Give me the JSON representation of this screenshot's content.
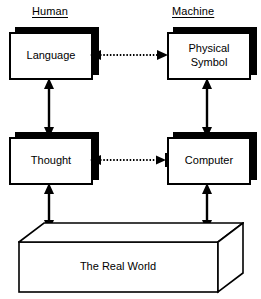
{
  "diagram": {
    "columns": [
      {
        "label": "Human"
      },
      {
        "label": "Machine"
      }
    ],
    "nodes": [
      {
        "id": "language",
        "label": "Language",
        "column": "Human",
        "row": "top"
      },
      {
        "id": "psymbol",
        "label": "Physical\nSymbol",
        "column": "Machine",
        "row": "top"
      },
      {
        "id": "thought",
        "label": "Thought",
        "column": "Human",
        "row": "middle"
      },
      {
        "id": "computer",
        "label": "Computer",
        "column": "Machine",
        "row": "middle"
      },
      {
        "id": "realworld",
        "label": "The Real World",
        "column": "both",
        "row": "bottom"
      }
    ],
    "connectors": [
      {
        "id": "language-physical-symbol",
        "from": "language",
        "to": "psymbol",
        "style": "dotted",
        "arrows": "both",
        "orientation": "horizontal"
      },
      {
        "id": "thought-computer",
        "from": "thought",
        "to": "computer",
        "style": "dotted",
        "arrows": "left-arrow-right-bar",
        "orientation": "horizontal"
      },
      {
        "id": "language-thought",
        "from": "language",
        "to": "thought",
        "style": "solid",
        "arrows": "both",
        "orientation": "vertical"
      },
      {
        "id": "physical-symbol-computer",
        "from": "psymbol",
        "to": "computer",
        "style": "solid",
        "arrows": "both",
        "orientation": "vertical"
      },
      {
        "id": "thought-realworld",
        "from": "thought",
        "to": "realworld",
        "style": "solid",
        "arrows": "both",
        "orientation": "vertical"
      },
      {
        "id": "computer-realworld",
        "from": "computer",
        "to": "realworld",
        "style": "solid",
        "arrows": "both",
        "orientation": "vertical"
      }
    ],
    "colors": {
      "background": "#ffffff",
      "stroke": "#000000",
      "fill": "#ffffff",
      "shadow": "#000000"
    }
  }
}
